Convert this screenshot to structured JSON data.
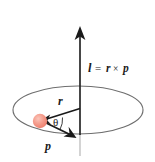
{
  "figure": {
    "background_color": "#ffffff",
    "width": 155,
    "height": 162
  },
  "colors": {
    "axis_stroke": "#262626",
    "axis_lower_stroke": "#b0b0b0",
    "ellipse_stroke": "#6e6e6e",
    "vector_stroke": "#1a1a1a",
    "arc_stroke": "#333333",
    "particle_fill": "#f08878",
    "particle_highlight": "#f8b3a6",
    "text": "#1a1a1a"
  },
  "labels": {
    "angular_momentum": {
      "symbol": "l",
      "equals": "=",
      "radius_symbol": "r",
      "cross": "×",
      "momentum_symbol": "p",
      "full": "l = r × p"
    },
    "radius_vector": "r",
    "momentum_vector": "p",
    "angle": "θ"
  },
  "elements": {
    "axis": {
      "name": "angular-momentum-axis",
      "x": 80,
      "y_top": 28,
      "y_bottom": 135,
      "y_tail": 156,
      "arrow_direction": "up"
    },
    "orbit": {
      "name": "circular-orbit",
      "center_x": 78,
      "center_y": 110,
      "radius_x": 65,
      "radius_y": 24
    },
    "particle": {
      "name": "orbiting-particle",
      "x": 40,
      "y": 121,
      "radius": 7
    },
    "radius_arrow": {
      "from_x": 80,
      "from_y": 108,
      "to_x": 42,
      "to_y": 120
    },
    "momentum_arrow": {
      "from_x": 40,
      "from_y": 120,
      "to_x": 75,
      "to_y": 137
    },
    "angle_arc": {
      "center_x": 41,
      "center_y": 120,
      "radius": 22
    }
  }
}
